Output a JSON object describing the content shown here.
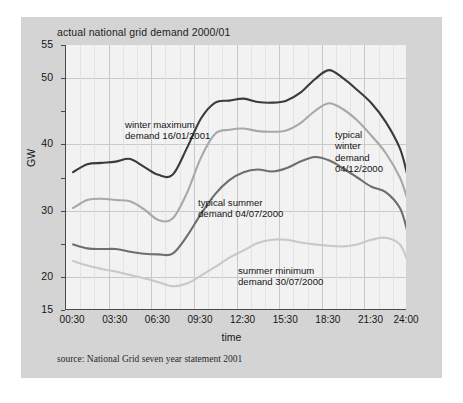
{
  "figure": {
    "title": "actual national grid demand 2000/01",
    "source": "source: National Grid seven year statement 2001"
  },
  "chart_data": {
    "type": "line",
    "title": "actual national grid demand 2000/01",
    "xlabel": "time",
    "ylabel": "GW",
    "xlim": [
      0,
      24
    ],
    "ylim": [
      15,
      55
    ],
    "yticks": [
      15,
      20,
      25,
      30,
      35,
      40,
      45,
      50,
      55
    ],
    "ytick_labels": [
      "15",
      "20",
      "",
      "30",
      "",
      "40",
      "",
      "50",
      "55"
    ],
    "xtick_labels": [
      "00:30",
      "03:30",
      "06:30",
      "09:30",
      "12:30",
      "15:30",
      "18:30",
      "21:30",
      "24:00"
    ],
    "xticks": [
      0.5,
      3.5,
      6.5,
      9.5,
      12.5,
      15.5,
      18.5,
      21.5,
      24.0
    ],
    "grid": "major horizontal at 20/30/40/50, vertical every 3 h with faint hourly minor lines",
    "legend": "none - series labelled by in-plot annotations",
    "x": [
      0.5,
      1.5,
      2.5,
      3.5,
      4.5,
      5.5,
      6.5,
      7.5,
      8.5,
      9.5,
      10.5,
      11.5,
      12.5,
      13.5,
      14.5,
      15.5,
      16.5,
      17.5,
      18.5,
      19.5,
      20.5,
      21.5,
      22.5,
      23.5,
      24.0
    ],
    "series": [
      {
        "name": "winter maximum demand 16/01/2001",
        "color": "#3b3b3b",
        "values": [
          35.8,
          37.0,
          37.2,
          37.4,
          37.8,
          36.6,
          35.4,
          35.4,
          39.4,
          43.9,
          46.3,
          46.6,
          46.9,
          46.4,
          46.3,
          46.6,
          47.8,
          49.8,
          51.2,
          50.0,
          48.2,
          46.2,
          43.4,
          39.4,
          35.6
        ]
      },
      {
        "name": "typical winter demand 04/12/2000",
        "color": "#a8a8a8",
        "values": [
          30.4,
          31.6,
          31.8,
          31.6,
          31.4,
          30.2,
          28.6,
          28.8,
          32.6,
          38.0,
          41.6,
          42.2,
          42.4,
          42.0,
          41.9,
          42.1,
          43.2,
          45.0,
          46.2,
          45.3,
          43.6,
          41.3,
          38.7,
          35.0,
          31.9
        ]
      },
      {
        "name": "typical summer demand 04/07/2000",
        "color": "#6e6e6e",
        "values": [
          24.9,
          24.3,
          24.2,
          24.2,
          23.8,
          23.5,
          23.4,
          23.5,
          26.1,
          29.5,
          32.5,
          34.6,
          35.8,
          36.2,
          35.9,
          36.4,
          37.4,
          38.1,
          37.6,
          36.4,
          35.0,
          33.6,
          32.8,
          30.4,
          27.1
        ]
      },
      {
        "name": "summer minimum demand 30/07/2000",
        "color": "#c8c8c8",
        "values": [
          22.4,
          21.7,
          21.2,
          20.8,
          20.3,
          19.8,
          19.2,
          18.6,
          19.0,
          20.2,
          21.5,
          22.9,
          24.0,
          25.1,
          25.6,
          25.6,
          25.2,
          24.9,
          24.7,
          24.6,
          24.9,
          25.6,
          25.9,
          24.9,
          22.6
        ]
      }
    ],
    "annotations": [
      {
        "text": "winter maximum\ndemand 16/01/2001",
        "x_px": 60,
        "y_px": 74
      },
      {
        "text": "typical\nwinter\ndemand\n04/12/2000",
        "x_px": 270,
        "y_px": 84
      },
      {
        "text": "typical summer\ndemand 04/07/2000",
        "x_px": 133,
        "y_px": 152
      },
      {
        "text": "summer minimum\ndemand 30/07/2000",
        "x_px": 173,
        "y_px": 220
      }
    ]
  }
}
